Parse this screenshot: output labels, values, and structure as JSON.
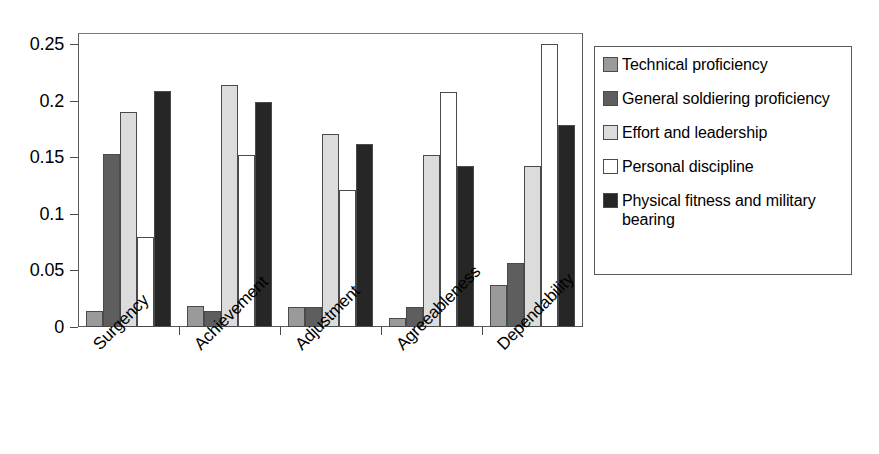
{
  "chart_data": {
    "type": "bar",
    "title": "",
    "subtitle": "",
    "xlabel": "",
    "ylabel": "",
    "ylim": [
      0,
      0.26
    ],
    "yticks": [
      "0",
      "0.05",
      "0.1",
      "0.15",
      "0.2",
      "0.25"
    ],
    "ytick_values": [
      0,
      0.05,
      0.1,
      0.15,
      0.2,
      0.25
    ],
    "grid": false,
    "legend_position": "right",
    "categories": [
      "Surgency",
      "Achievement",
      "Adjustment",
      "Agreeableness",
      "Dependability"
    ],
    "series": [
      {
        "name": "Technical proficiency",
        "color": "#9a9a9a",
        "values": [
          0.014,
          0.019,
          0.018,
          0.008,
          0.037
        ]
      },
      {
        "name": "General soldiering proficiency",
        "color": "#5e5e5e",
        "values": [
          0.153,
          0.014,
          0.018,
          0.018,
          0.057
        ]
      },
      {
        "name": "Effort and leadership",
        "color": "#dcdcdc",
        "values": [
          0.19,
          0.214,
          0.171,
          0.152,
          0.142
        ]
      },
      {
        "name": "Personal discipline",
        "color": "#ffffff",
        "values": [
          0.08,
          0.152,
          0.121,
          0.208,
          0.25
        ]
      },
      {
        "name": "Physical fitness and military bearing",
        "color": "#262626",
        "values": [
          0.209,
          0.199,
          0.162,
          0.142,
          0.179
        ]
      }
    ]
  },
  "legend": {
    "items": [
      {
        "label": "Technical proficiency",
        "color": "#9a9a9a"
      },
      {
        "label": "General soldiering proficiency",
        "color": "#5e5e5e"
      },
      {
        "label": "Effort and leadership",
        "color": "#dcdcdc"
      },
      {
        "label": "Personal discipline",
        "color": "#ffffff"
      },
      {
        "label": "Physical fitness and military bearing",
        "color": "#262626"
      }
    ]
  }
}
